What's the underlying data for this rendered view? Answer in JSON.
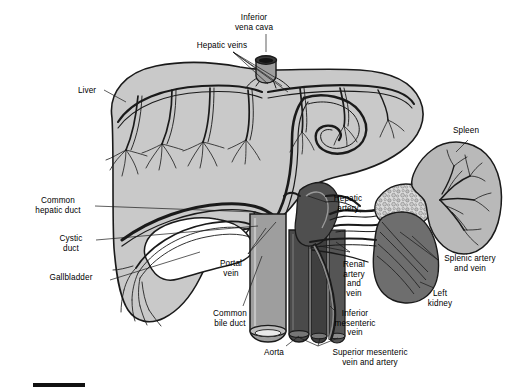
{
  "figure": {
    "type": "anatomical-illustration",
    "style": "black-and-white line drawing with gray tonal fills",
    "background_color": "#ffffff",
    "has_scale_bar": true
  },
  "palette": {
    "outline": "#1a1a1a",
    "liver_fill": "#c9c9c9",
    "spleen_fill": "#b9b9b9",
    "kidney_fill": "#6e6e6e",
    "vena_cava_fill": "#9e9e9e",
    "aorta_fill": "#4a4a4a",
    "artery_fill": "#7d7d7d",
    "pancreas_fill": "#dcdcdc",
    "gallbladder_fill": "#ffffff",
    "leader_line": "#1a1a1a"
  },
  "labels": [
    {
      "id": "inferior-vena-cava",
      "text": "Inferior\nvena cava",
      "x": 254,
      "y": 18,
      "align": "center"
    },
    {
      "id": "hepatic-veins",
      "text": "Hepatic veins",
      "x": 222,
      "y": 45,
      "align": "center"
    },
    {
      "id": "liver",
      "text": "Liver",
      "x": 87,
      "y": 90,
      "align": "center"
    },
    {
      "id": "spleen",
      "text": "Spleen",
      "x": 466,
      "y": 130,
      "align": "center"
    },
    {
      "id": "common-hepatic-duct",
      "text": "Common\nhepatic duct",
      "x": 58,
      "y": 200,
      "align": "center"
    },
    {
      "id": "hepatic-artery",
      "text": "Hepatic\nartery",
      "x": 348,
      "y": 198,
      "align": "center"
    },
    {
      "id": "cystic-duct",
      "text": "Cystic\nduct",
      "x": 71,
      "y": 238,
      "align": "center"
    },
    {
      "id": "portal-vein",
      "text": "Portal\nvein",
      "x": 231,
      "y": 263,
      "align": "center"
    },
    {
      "id": "gallbladder",
      "text": "Gallbladder",
      "x": 71,
      "y": 277,
      "align": "center"
    },
    {
      "id": "splenic-artery-and-vein",
      "text": "Splenic artery\nand vein",
      "x": 470,
      "y": 258,
      "align": "center"
    },
    {
      "id": "renal-artery-and-vein",
      "text": "Renal\nartery\nand\nvein",
      "x": 354,
      "y": 264,
      "align": "center"
    },
    {
      "id": "left-kidney",
      "text": "Left\nkidney",
      "x": 440,
      "y": 293,
      "align": "center"
    },
    {
      "id": "common-bile-duct",
      "text": "Common\nbile duct",
      "x": 230,
      "y": 313,
      "align": "center"
    },
    {
      "id": "inferior-mesenteric-vein",
      "text": "Inferior\nmesenteric\nvein",
      "x": 355,
      "y": 313,
      "align": "center"
    },
    {
      "id": "aorta",
      "text": "Aorta",
      "x": 274,
      "y": 352,
      "align": "center"
    },
    {
      "id": "superior-mesenteric-vein-and-artery",
      "text": "Superior mesenteric\nvein and artery",
      "x": 370,
      "y": 352,
      "align": "center"
    }
  ],
  "structures": [
    {
      "id": "liver",
      "name": "Liver"
    },
    {
      "id": "gallbladder",
      "name": "Gallbladder"
    },
    {
      "id": "inferior-vena-cava",
      "name": "Inferior vena cava"
    },
    {
      "id": "hepatic-veins",
      "name": "Hepatic veins"
    },
    {
      "id": "hepatic-artery",
      "name": "Hepatic artery"
    },
    {
      "id": "portal-vein",
      "name": "Portal vein"
    },
    {
      "id": "common-hepatic-duct",
      "name": "Common hepatic duct"
    },
    {
      "id": "cystic-duct",
      "name": "Cystic duct"
    },
    {
      "id": "common-bile-duct",
      "name": "Common bile duct"
    },
    {
      "id": "aorta",
      "name": "Aorta"
    },
    {
      "id": "spleen",
      "name": "Spleen"
    },
    {
      "id": "pancreas",
      "name": "Pancreas"
    },
    {
      "id": "left-kidney",
      "name": "Left kidney"
    },
    {
      "id": "splenic-artery-and-vein",
      "name": "Splenic artery and vein"
    },
    {
      "id": "renal-artery-and-vein",
      "name": "Renal artery and vein"
    },
    {
      "id": "superior-mesenteric-vein-and-artery",
      "name": "Superior mesenteric vein and artery"
    },
    {
      "id": "inferior-mesenteric-vein",
      "name": "Inferior mesenteric vein"
    }
  ]
}
